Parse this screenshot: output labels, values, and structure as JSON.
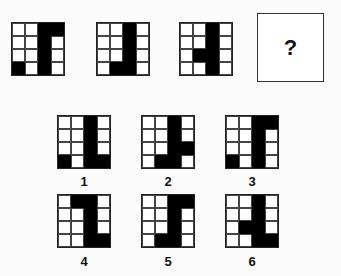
{
  "sequence": {
    "grids": [
      {
        "cells": [
          [
            0,
            0,
            1,
            1
          ],
          [
            0,
            0,
            1,
            0
          ],
          [
            0,
            0,
            1,
            0
          ],
          [
            1,
            0,
            1,
            0
          ]
        ]
      },
      {
        "cells": [
          [
            0,
            0,
            1,
            0
          ],
          [
            0,
            0,
            1,
            0
          ],
          [
            0,
            0,
            1,
            0
          ],
          [
            0,
            1,
            1,
            0
          ]
        ]
      },
      {
        "cells": [
          [
            0,
            0,
            1,
            0
          ],
          [
            0,
            0,
            1,
            0
          ],
          [
            0,
            1,
            1,
            0
          ],
          [
            0,
            0,
            1,
            0
          ]
        ]
      }
    ],
    "question_mark": "?"
  },
  "options": [
    {
      "label": "1",
      "cells": [
        [
          0,
          0,
          1,
          0
        ],
        [
          0,
          0,
          1,
          0
        ],
        [
          0,
          0,
          1,
          0
        ],
        [
          1,
          0,
          1,
          1
        ]
      ]
    },
    {
      "label": "2",
      "cells": [
        [
          0,
          0,
          1,
          0
        ],
        [
          0,
          0,
          1,
          0
        ],
        [
          0,
          0,
          1,
          1
        ],
        [
          0,
          1,
          1,
          0
        ]
      ]
    },
    {
      "label": "3",
      "cells": [
        [
          0,
          0,
          1,
          1
        ],
        [
          0,
          0,
          1,
          0
        ],
        [
          0,
          0,
          1,
          0
        ],
        [
          1,
          0,
          1,
          0
        ]
      ]
    },
    {
      "label": "4",
      "cells": [
        [
          0,
          1,
          1,
          0
        ],
        [
          0,
          0,
          1,
          0
        ],
        [
          0,
          0,
          1,
          0
        ],
        [
          0,
          0,
          1,
          1
        ]
      ]
    },
    {
      "label": "5",
      "cells": [
        [
          0,
          0,
          1,
          1
        ],
        [
          0,
          0,
          1,
          0
        ],
        [
          0,
          0,
          1,
          0
        ],
        [
          0,
          1,
          1,
          0
        ]
      ]
    },
    {
      "label": "6",
      "cells": [
        [
          0,
          0,
          1,
          0
        ],
        [
          0,
          0,
          1,
          0
        ],
        [
          0,
          1,
          1,
          0
        ],
        [
          0,
          0,
          1,
          1
        ]
      ]
    }
  ]
}
